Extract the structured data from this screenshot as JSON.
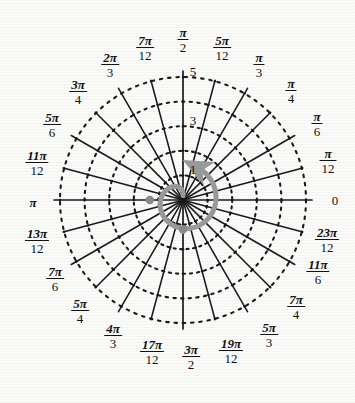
{
  "figure": {
    "type": "polar-grid",
    "title": "",
    "center": {
      "x": 183,
      "y": 200
    },
    "outer_radius_px": 123,
    "radial_ticks": [
      {
        "label": "1",
        "r": 1
      },
      {
        "label": "3",
        "r": 3
      },
      {
        "label": "5",
        "r": 5
      }
    ],
    "radial_rings": [
      1,
      2,
      3,
      4,
      5
    ],
    "ring_style": "dotted",
    "ray_style": "solid",
    "angle_step": "pi/12",
    "num_rays": 24,
    "colors": {
      "grid": "#1a1a1a",
      "curve": "#9a9a9a",
      "marker": "#8a8a8a",
      "background": "#fbfbf9",
      "text": "#111111"
    },
    "curve": {
      "name": "spiral-arc",
      "stroke": "#9a9a9a",
      "stroke_width_px": 5,
      "arrow_direction": "counterclockwise",
      "arrow_angle": "pi/12",
      "markers": [
        {
          "angle": "pi",
          "r": 1.35
        },
        {
          "angle": "3pi/2",
          "r": 1.2
        }
      ]
    },
    "angle_labels": [
      {
        "id": "a0",
        "num": "",
        "den": "",
        "plain": "0",
        "angle_deg": 0,
        "x": 335,
        "y": 200
      },
      {
        "id": "a1",
        "num": "π",
        "den": "12",
        "plain": "",
        "angle_deg": 15,
        "x": 328,
        "y": 161
      },
      {
        "id": "a2",
        "num": "π",
        "den": "6",
        "plain": "",
        "angle_deg": 30,
        "x": 317,
        "y": 124
      },
      {
        "id": "a3",
        "num": "π",
        "den": "4",
        "plain": "",
        "angle_deg": 45,
        "x": 291,
        "y": 91
      },
      {
        "id": "a4",
        "num": "π",
        "den": "3",
        "plain": "",
        "angle_deg": 60,
        "x": 259,
        "y": 65
      },
      {
        "id": "a5",
        "num": "5π",
        "den": "12",
        "plain": "",
        "angle_deg": 75,
        "x": 222,
        "y": 48
      },
      {
        "id": "a6",
        "num": "π",
        "den": "2",
        "plain": "",
        "angle_deg": 90,
        "x": 183,
        "y": 40
      },
      {
        "id": "a7",
        "num": "7π",
        "den": "12",
        "plain": "",
        "angle_deg": 105,
        "x": 145,
        "y": 48
      },
      {
        "id": "a8",
        "num": "2π",
        "den": "3",
        "plain": "",
        "angle_deg": 120,
        "x": 110,
        "y": 65
      },
      {
        "id": "a9",
        "num": "3π",
        "den": "4",
        "plain": "",
        "angle_deg": 135,
        "x": 78,
        "y": 92
      },
      {
        "id": "a10",
        "num": "5π",
        "den": "6",
        "plain": "",
        "angle_deg": 150,
        "x": 52,
        "y": 125
      },
      {
        "id": "a11",
        "num": "11π",
        "den": "12",
        "plain": "",
        "angle_deg": 165,
        "x": 37,
        "y": 163
      },
      {
        "id": "a12",
        "num": "",
        "den": "",
        "plain": "π",
        "angle_deg": 180,
        "x": 33,
        "y": 202
      },
      {
        "id": "a13",
        "num": "13π",
        "den": "12",
        "plain": "",
        "angle_deg": 195,
        "x": 37,
        "y": 241
      },
      {
        "id": "a14",
        "num": "7π",
        "den": "6",
        "plain": "",
        "angle_deg": 210,
        "x": 55,
        "y": 279
      },
      {
        "id": "a15",
        "num": "5π",
        "den": "4",
        "plain": "",
        "angle_deg": 225,
        "x": 80,
        "y": 311
      },
      {
        "id": "a16",
        "num": "4π",
        "den": "3",
        "plain": "",
        "angle_deg": 240,
        "x": 113,
        "y": 336
      },
      {
        "id": "a17",
        "num": "17π",
        "den": "12",
        "plain": "",
        "angle_deg": 255,
        "x": 152,
        "y": 352
      },
      {
        "id": "a18",
        "num": "3π",
        "den": "2",
        "plain": "",
        "angle_deg": 270,
        "x": 191,
        "y": 357
      },
      {
        "id": "a19",
        "num": "19π",
        "den": "12",
        "plain": "",
        "angle_deg": 285,
        "x": 231,
        "y": 351
      },
      {
        "id": "a20",
        "num": "5π",
        "den": "3",
        "plain": "",
        "angle_deg": 300,
        "x": 269,
        "y": 335
      },
      {
        "id": "a21",
        "num": "7π",
        "den": "4",
        "plain": "",
        "angle_deg": 315,
        "x": 296,
        "y": 307
      },
      {
        "id": "a22",
        "num": "11π",
        "den": "6",
        "plain": "",
        "angle_deg": 330,
        "x": 318,
        "y": 272
      },
      {
        "id": "a23",
        "num": "23π",
        "den": "12",
        "plain": "",
        "angle_deg": 345,
        "x": 327,
        "y": 240
      }
    ]
  }
}
